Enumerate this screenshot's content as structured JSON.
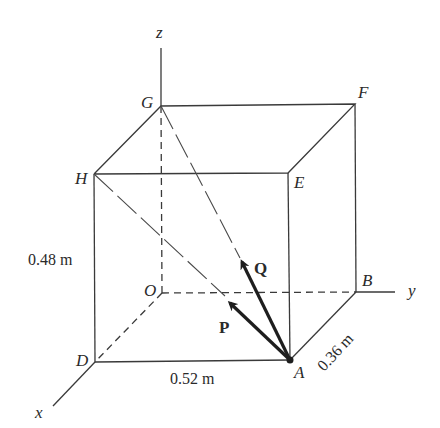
{
  "figure": {
    "points": {
      "O": {
        "label": "O",
        "x": 162,
        "y": 293
      },
      "A": {
        "label": "A",
        "x": 290,
        "y": 360
      },
      "B": {
        "label": "B",
        "x": 356,
        "y": 292
      },
      "D": {
        "label": "D",
        "x": 95,
        "y": 362
      },
      "E": {
        "label": "E",
        "x": 288,
        "y": 173
      },
      "F": {
        "label": "F",
        "x": 355,
        "y": 104
      },
      "G": {
        "label": "G",
        "x": 161,
        "y": 106
      },
      "H": {
        "label": "H",
        "x": 94,
        "y": 174
      }
    },
    "axes": {
      "x": {
        "label": "x"
      },
      "y": {
        "label": "y"
      },
      "z": {
        "label": "z"
      }
    },
    "dimensions": {
      "height": "0.48 m",
      "length": "0.52 m",
      "depth": "0.36 m"
    },
    "vectors": {
      "P": {
        "label": "P",
        "from": "A",
        "toward": "H"
      },
      "Q": {
        "label": "Q",
        "from": "A",
        "toward": "G"
      }
    },
    "colors": {
      "line": "#3a3a3a",
      "vector": "#1e1e1e",
      "background": "#ffffff"
    }
  }
}
